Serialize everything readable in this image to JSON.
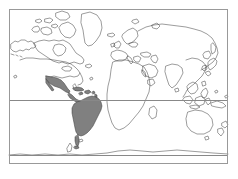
{
  "figure": {
    "type": "world-map",
    "projection": "equirectangular",
    "caption": "",
    "background_color": "#ffffff"
  },
  "frame": {
    "label": "map-border",
    "stroke_color": "#999999",
    "stroke_width": 1,
    "x": 9,
    "y": 9,
    "width": 219,
    "height": 155
  },
  "graticule": {
    "label": "latitude-reference-lines",
    "stroke_color": "#888888",
    "lines": [
      {
        "name": "equator",
        "latitude": 0,
        "y": 100
      },
      {
        "name": "antarctic-coast-line",
        "latitude": -60,
        "y": 155
      }
    ]
  },
  "coastlines": {
    "label": "world-coastlines",
    "stroke_color": "#3a3a3a",
    "stroke_width": 0.5,
    "fill": "none"
  },
  "highlight": {
    "label": "latin-america-highlight",
    "fill_color": "#808080",
    "stroke_color": "#3a3a3a",
    "regions": [
      "Mexico",
      "Central America",
      "Caribbean",
      "South America"
    ]
  },
  "legend": {
    "visible": false,
    "entries": []
  },
  "labels": {
    "visible": false,
    "items": []
  }
}
